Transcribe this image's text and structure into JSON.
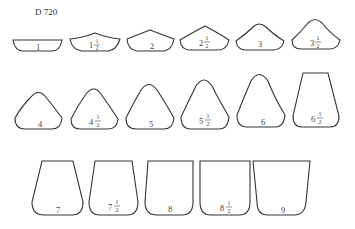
{
  "title": "D 720",
  "shapes": [
    {
      "id": "1",
      "label": "1",
      "whole": "1",
      "half": false
    },
    {
      "id": "1.5",
      "label": "1½",
      "whole": "1",
      "half": true
    },
    {
      "id": "2",
      "label": "2",
      "whole": "2",
      "half": false
    },
    {
      "id": "2.5",
      "label": "2½",
      "whole": "2",
      "half": true
    },
    {
      "id": "3",
      "label": "3",
      "whole": "3",
      "half": false
    },
    {
      "id": "3.5",
      "label": "3½",
      "whole": "3",
      "half": true
    },
    {
      "id": "4",
      "label": "4",
      "whole": "4",
      "half": false
    },
    {
      "id": "4.5",
      "label": "4½",
      "whole": "4",
      "half": true
    },
    {
      "id": "5",
      "label": "5",
      "whole": "5",
      "half": false
    },
    {
      "id": "5.5",
      "label": "5½",
      "whole": "5",
      "half": true
    },
    {
      "id": "6",
      "label": "6",
      "whole": "6",
      "half": false
    },
    {
      "id": "6.5",
      "label": "6½",
      "whole": "6",
      "half": true
    },
    {
      "id": "7",
      "label": "7",
      "whole": "7",
      "half": false
    },
    {
      "id": "7.5",
      "label": "7½",
      "whole": "7",
      "half": true
    },
    {
      "id": "8",
      "label": "8",
      "whole": "8",
      "half": false
    },
    {
      "id": "8.5",
      "label": "8½",
      "whole": "8",
      "half": true
    },
    {
      "id": "9",
      "label": "9",
      "whole": "9",
      "half": false
    }
  ],
  "fraction": {
    "num": "1",
    "den": "2"
  }
}
